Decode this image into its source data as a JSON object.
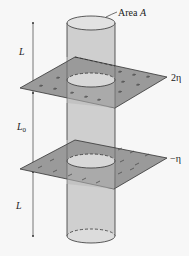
{
  "figure": {
    "labels": {
      "area": "Area",
      "area_symbol": "A",
      "length_top": "L",
      "length_middle": "L",
      "length_middle_sub": "0",
      "length_bottom": "L",
      "upper_charge_density": "2η",
      "lower_charge_density": "−η"
    },
    "upper_plane": {
      "charge_sign": "+",
      "density": "2η"
    },
    "lower_plane": {
      "charge_sign": "−",
      "density": "−η"
    },
    "colors": {
      "background": "#f7f7f7",
      "plane_fill": "#9a9a9a",
      "cylinder_fill": "#cfcfcf",
      "cap_fill": "#e2e2e2",
      "stroke": "#333333"
    }
  }
}
